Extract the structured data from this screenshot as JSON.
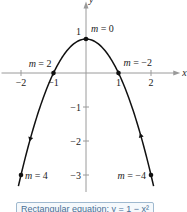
{
  "diagram": {
    "axes": {
      "x_label": "x",
      "y_label": "y",
      "x_ticks": [
        {
          "value": -2,
          "label": "−2"
        },
        {
          "value": -1,
          "label": "−1"
        },
        {
          "value": 1,
          "label": "1"
        },
        {
          "value": 2,
          "label": "2"
        }
      ],
      "y_ticks": [
        {
          "value": 1,
          "label": "1"
        },
        {
          "value": -1,
          "label": "−1"
        },
        {
          "value": -2,
          "label": "−2"
        },
        {
          "value": -3,
          "label": "−3"
        }
      ],
      "x_range": [
        -2.6,
        2.9
      ],
      "y_range": [
        -3.5,
        2.1
      ]
    },
    "curve": {
      "equation": "y = 1 - x^2",
      "x_domain": [
        -2.08,
        2.08
      ],
      "direction_arrows": [
        {
          "x": -1.7,
          "direction": "down"
        },
        {
          "x": 1.7,
          "direction": "up"
        }
      ]
    },
    "points": [
      {
        "x": 0,
        "y": 1,
        "label": "m = 0",
        "label_side": "right-above"
      },
      {
        "x": -1,
        "y": 0,
        "label": "m = 2",
        "label_side": "left-above"
      },
      {
        "x": 1,
        "y": 0,
        "label": "m = −2",
        "label_side": "right-above"
      },
      {
        "x": -2,
        "y": -3,
        "label": "m = 4",
        "label_side": "right"
      },
      {
        "x": 2,
        "y": -3,
        "label": "m = −4",
        "label_side": "left"
      }
    ],
    "caption": "Rectangular equation: y = 1 − x²"
  }
}
